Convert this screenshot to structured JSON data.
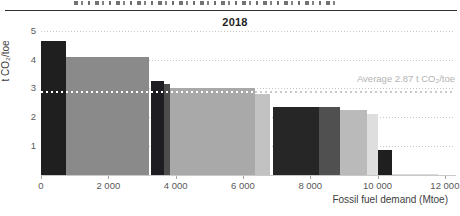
{
  "chart_data": {
    "type": "bar",
    "variant": "variable-width-marimekko",
    "title": "2018",
    "xlabel": "Fossil fuel demand (Mtoe)",
    "ylabel": "t CO₂/toe",
    "xlim": [
      0,
      12300
    ],
    "ylim": [
      0,
      5
    ],
    "grid": "dotted horizontal gridlines at integer values",
    "legend": "none",
    "x_ticks": [
      {
        "value": 0,
        "label": "0"
      },
      {
        "value": 2000,
        "label": "2 000"
      },
      {
        "value": 4000,
        "label": "4 000"
      },
      {
        "value": 6000,
        "label": "6 000"
      },
      {
        "value": 8000,
        "label": "8 000"
      },
      {
        "value": 10000,
        "label": "10 000"
      },
      {
        "value": 12000,
        "label": "12 000"
      }
    ],
    "y_ticks": [
      1,
      2,
      3,
      4,
      5
    ],
    "average_line": {
      "value": 2.87,
      "label": "Average 2.87 t CO₂/toe",
      "style": "dotted"
    },
    "bars": [
      {
        "x0": 0,
        "x1": 740,
        "value": 4.65,
        "color": "#1f1f1f"
      },
      {
        "x0": 740,
        "x1": 3200,
        "value": 4.1,
        "color": "#8a8a8a"
      },
      {
        "x0": 3260,
        "x1": 3640,
        "value": 3.25,
        "color": "#1e1e22"
      },
      {
        "x0": 3640,
        "x1": 3830,
        "value": 3.15,
        "color": "#4d4d4d"
      },
      {
        "x0": 3830,
        "x1": 6360,
        "value": 3.0,
        "color": "#a9a9a9"
      },
      {
        "x0": 6360,
        "x1": 6810,
        "value": 2.8,
        "color": "#c2c2c2"
      },
      {
        "x0": 6900,
        "x1": 8260,
        "value": 2.37,
        "color": "#262626"
      },
      {
        "x0": 8260,
        "x1": 8880,
        "value": 2.37,
        "color": "#505050"
      },
      {
        "x0": 8880,
        "x1": 9680,
        "value": 2.25,
        "color": "#bababa"
      },
      {
        "x0": 9680,
        "x1": 10020,
        "value": 2.1,
        "color": "#dedede"
      },
      {
        "x0": 10020,
        "x1": 10420,
        "value": 0.85,
        "color": "#1f1f1f"
      },
      {
        "x0": 10420,
        "x1": 11800,
        "value": 0.05,
        "color": "#d9d9d9"
      }
    ]
  }
}
